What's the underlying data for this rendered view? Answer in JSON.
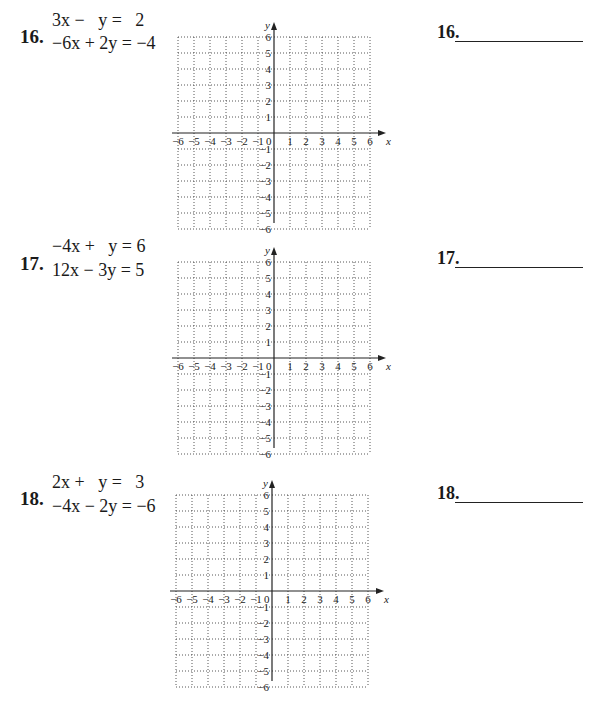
{
  "problems": [
    {
      "number": "16.",
      "equations": [
        "3x −   y =   2",
        "−6x + 2y = −4"
      ],
      "answer_label": "16.",
      "answer_value": ""
    },
    {
      "number": "17.",
      "equations": [
        "−4x +   y = 6",
        "12x − 3y = 5"
      ],
      "answer_label": "17.",
      "answer_value": ""
    },
    {
      "number": "18.",
      "equations": [
        "2x +   y =   3",
        "−4x − 2y = −6"
      ],
      "answer_label": "18.",
      "answer_value": ""
    }
  ],
  "graph": {
    "x_label": "x",
    "y_label": "y",
    "origin_label": "0",
    "x_ticks": [
      "−6",
      "−5",
      "−4",
      "−3",
      "−2",
      "−1",
      "1",
      "2",
      "3",
      "4",
      "5",
      "6"
    ],
    "y_ticks_pos": [
      "1",
      "2",
      "3",
      "4",
      "5",
      "6"
    ],
    "y_ticks_neg": [
      "−1",
      "−2",
      "−3",
      "−4",
      "−5",
      "−6"
    ],
    "range": [
      -6,
      6
    ],
    "grid": "dotted"
  }
}
